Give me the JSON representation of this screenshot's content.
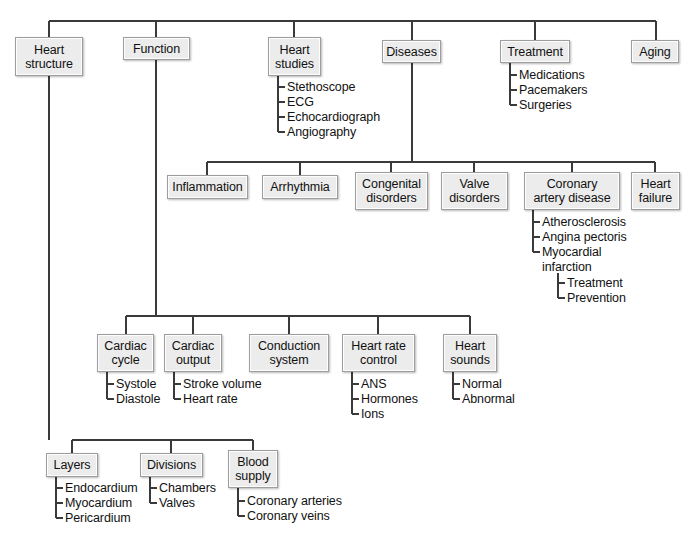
{
  "diagram": {
    "root_label": "",
    "colors": {
      "box_fill": "#ececec",
      "box_border": "#9d9d9d",
      "line": "#3a3a3a",
      "text": "#111111"
    },
    "nodes": [
      {
        "id": "heart_structure",
        "label": "Heart\nstructure",
        "x": 15,
        "y": 37,
        "w": 68,
        "h": 39
      },
      {
        "id": "function",
        "label": "Function",
        "x": 123,
        "y": 37,
        "w": 67,
        "h": 23
      },
      {
        "id": "heart_studies",
        "label": "Heart\nstudies",
        "x": 268,
        "y": 37,
        "w": 53,
        "h": 39
      },
      {
        "id": "diseases",
        "label": "Diseases",
        "x": 382,
        "y": 40,
        "w": 59,
        "h": 23
      },
      {
        "id": "treatment",
        "label": "Treatment",
        "x": 500,
        "y": 40,
        "w": 70,
        "h": 23
      },
      {
        "id": "aging",
        "label": "Aging",
        "x": 631,
        "y": 40,
        "w": 48,
        "h": 23
      },
      {
        "id": "inflammation",
        "label": "Inflammation",
        "x": 167,
        "y": 175,
        "w": 81,
        "h": 24
      },
      {
        "id": "arrhythmia",
        "label": "Arrhythmia",
        "x": 262,
        "y": 175,
        "w": 76,
        "h": 24
      },
      {
        "id": "congenital_disorders",
        "label": "Congenital\ndisorders",
        "x": 355,
        "y": 172,
        "w": 73,
        "h": 38
      },
      {
        "id": "valve_disorders",
        "label": "Valve\ndisorders",
        "x": 441,
        "y": 172,
        "w": 67,
        "h": 38
      },
      {
        "id": "coronary_artery_disease",
        "label": "Coronary\nartery disease",
        "x": 524,
        "y": 172,
        "w": 96,
        "h": 38
      },
      {
        "id": "heart_failure",
        "label": "Heart\nfailure",
        "x": 631,
        "y": 172,
        "w": 49,
        "h": 38
      },
      {
        "id": "cardiac_cycle",
        "label": "Cardiac\ncycle",
        "x": 97,
        "y": 334,
        "w": 57,
        "h": 38
      },
      {
        "id": "cardiac_output",
        "label": "Cardiac\noutput",
        "x": 164,
        "y": 334,
        "w": 58,
        "h": 38
      },
      {
        "id": "conduction_system",
        "label": "Conduction\nsystem",
        "x": 249,
        "y": 334,
        "w": 80,
        "h": 38
      },
      {
        "id": "heart_rate_control",
        "label": "Heart rate\ncontrol",
        "x": 342,
        "y": 334,
        "w": 73,
        "h": 38
      },
      {
        "id": "heart_sounds",
        "label": "Heart\nsounds",
        "x": 443,
        "y": 334,
        "w": 54,
        "h": 38
      },
      {
        "id": "layers",
        "label": "Layers",
        "x": 46,
        "y": 453,
        "w": 52,
        "h": 24
      },
      {
        "id": "divisions",
        "label": "Divisions",
        "x": 140,
        "y": 453,
        "w": 63,
        "h": 24
      },
      {
        "id": "blood_supply",
        "label": "Blood\nsupply",
        "x": 228,
        "y": 450,
        "w": 50,
        "h": 38
      }
    ],
    "leaf_groups": [
      {
        "id": "heart_studies_leaves",
        "parent": "heart_studies",
        "x": 278,
        "y": 80,
        "stem_x": 278,
        "items": [
          "Stethoscope",
          "ECG",
          "Echocardiograph",
          "Angiography"
        ]
      },
      {
        "id": "treatment_leaves",
        "parent": "treatment",
        "x": 510,
        "y": 68,
        "stem_x": 510,
        "items": [
          "Medications",
          "Pacemakers",
          "Surgeries"
        ]
      },
      {
        "id": "coronary_artery_disease_leaves",
        "parent": "coronary_artery_disease",
        "x": 533,
        "y": 215,
        "stem_x": 533,
        "items": [
          "Atherosclerosis",
          "Angina pectoris",
          "Myocardial\ninfarction"
        ]
      },
      {
        "id": "myocardial_infarction_leaves",
        "parent": "myocardial_infarction",
        "x": 558,
        "y": 276,
        "stem_x": 558,
        "items": [
          "Treatment",
          "Prevention"
        ]
      },
      {
        "id": "cardiac_cycle_leaves",
        "parent": "cardiac_cycle",
        "x": 107,
        "y": 377,
        "stem_x": 107,
        "items": [
          "Systole",
          "Diastole"
        ]
      },
      {
        "id": "cardiac_output_leaves",
        "parent": "cardiac_output",
        "x": 174,
        "y": 377,
        "stem_x": 174,
        "items": [
          "Stroke volume",
          "Heart rate"
        ]
      },
      {
        "id": "heart_rate_control_leaves",
        "parent": "heart_rate_control",
        "x": 352,
        "y": 377,
        "stem_x": 352,
        "items": [
          "ANS",
          "Hormones",
          "Ions"
        ]
      },
      {
        "id": "heart_sounds_leaves",
        "parent": "heart_sounds",
        "x": 453,
        "y": 377,
        "stem_x": 453,
        "items": [
          "Normal",
          "Abnormal"
        ]
      },
      {
        "id": "layers_leaves",
        "parent": "layers",
        "x": 56,
        "y": 481,
        "stem_x": 56,
        "items": [
          "Endocardium",
          "Myocardium",
          "Pericardium"
        ]
      },
      {
        "id": "divisions_leaves",
        "parent": "divisions",
        "x": 150,
        "y": 481,
        "stem_x": 150,
        "items": [
          "Chambers",
          "Valves"
        ]
      },
      {
        "id": "blood_supply_leaves",
        "parent": "blood_supply",
        "x": 238,
        "y": 494,
        "stem_x": 238,
        "items": [
          "Coronary arteries",
          "Coronary veins"
        ]
      }
    ],
    "buses": [
      {
        "id": "root-bus",
        "label": "root level connector",
        "y": 21,
        "x1": 49,
        "x2": 656,
        "drops": [
          49,
          156,
          294,
          412,
          535,
          656
        ]
      },
      {
        "id": "diseases-bus",
        "label": "diseases level connector",
        "y": 162,
        "x1": 207,
        "x2": 655,
        "drops": [
          207,
          300,
          391,
          474,
          572,
          655
        ]
      },
      {
        "id": "function-bus",
        "label": "function level connector",
        "y": 316,
        "x1": 126,
        "x2": 470,
        "drops": [
          126,
          193,
          289,
          378,
          470
        ]
      },
      {
        "id": "structure-bus",
        "label": "heart structure level connector",
        "y": 440,
        "x1": 72,
        "x2": 253,
        "drops": [
          72,
          171,
          253
        ]
      }
    ]
  }
}
